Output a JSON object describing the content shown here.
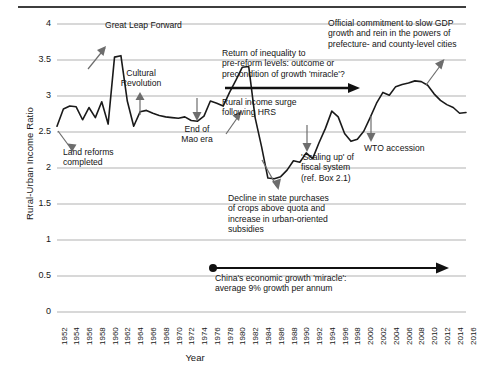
{
  "figure": {
    "y_axis_title": "Rural-Urban Income Ratio",
    "x_axis_title": "Year"
  },
  "chart_data": {
    "type": "line",
    "title": "",
    "xlabel": "Year",
    "ylabel": "Rural-Urban Income Ratio",
    "ylim": [
      0,
      4
    ],
    "ytick_labels": [
      "0",
      "0.5",
      "1",
      "1.5",
      "2",
      "2.5",
      "3",
      "3.5",
      "4"
    ],
    "ytick_values": [
      0,
      0.5,
      1,
      1.5,
      2,
      2.5,
      3,
      3.5,
      4
    ],
    "grid": "horizontal",
    "legend": "none",
    "xtick_labels": [
      "1952",
      "1954",
      "1956",
      "1958",
      "1960",
      "1962",
      "1964",
      "1966",
      "1968",
      "1970",
      "1972",
      "1974",
      "1976",
      "1978",
      "1980",
      "1982",
      "1984",
      "1986",
      "1988",
      "1990",
      "1992",
      "1994",
      "1996",
      "1998",
      "2000",
      "2002",
      "2004",
      "2006",
      "2008",
      "2010",
      "2012",
      "2014",
      "2016"
    ],
    "x": [
      1952,
      1953,
      1954,
      1955,
      1956,
      1957,
      1958,
      1959,
      1960,
      1961,
      1962,
      1963,
      1964,
      1965,
      1966,
      1967,
      1968,
      1969,
      1970,
      1971,
      1972,
      1973,
      1974,
      1975,
      1976,
      1977,
      1978,
      1979,
      1980,
      1981,
      1982,
      1983,
      1984,
      1985,
      1986,
      1987,
      1988,
      1989,
      1990,
      1991,
      1992,
      1993,
      1994,
      1995,
      1996,
      1997,
      1998,
      1999,
      2000,
      2001,
      2002,
      2003,
      2004,
      2005,
      2006,
      2007,
      2008,
      2009,
      2010,
      2011,
      2012,
      2013,
      2014,
      2015,
      2016
    ],
    "values": [
      2.58,
      2.82,
      2.86,
      2.85,
      2.67,
      2.84,
      2.7,
      2.92,
      2.61,
      3.54,
      3.56,
      2.93,
      2.58,
      2.78,
      2.8,
      2.76,
      2.73,
      2.71,
      2.7,
      2.69,
      2.71,
      2.66,
      2.65,
      2.72,
      2.93,
      2.9,
      2.86,
      3.05,
      3.22,
      3.4,
      3.41,
      2.7,
      2.3,
      1.86,
      1.85,
      1.88,
      1.97,
      2.1,
      2.08,
      2.21,
      2.13,
      2.35,
      2.55,
      2.79,
      2.71,
      2.48,
      2.37,
      2.4,
      2.51,
      2.7,
      2.9,
      3.05,
      3.01,
      3.13,
      3.16,
      3.18,
      3.21,
      3.2,
      3.15,
      3.03,
      2.94,
      2.88,
      2.84,
      2.76,
      2.77
    ],
    "annotations": [
      {
        "id": "land-reforms",
        "text": "Land reforms\ncompleted",
        "arrow": "down-left-to-upper-left"
      },
      {
        "id": "great-leap-forward",
        "text": "Great Leap Forward",
        "arrow": "up-left"
      },
      {
        "id": "cultural-revolution",
        "text": "Cultural\nRevolution",
        "arrow": "up"
      },
      {
        "id": "end-of-mao-era",
        "text": "End of\nMao era",
        "arrow": "down"
      },
      {
        "id": "return-of-inequality",
        "text": "Return of inequality to\npre-reform levels: outcome or\nprecondition of growth 'miracle'?",
        "arrow": "right-long"
      },
      {
        "id": "rural-income-surge",
        "text": "Rural income surge\nfollowing HRS",
        "arrow": "up-left"
      },
      {
        "id": "decline-state-purchases",
        "text": "Decline in state purchases\nof crops above quota and\nincrease in urban-oriented\nsubsidies",
        "arrow": "down-right"
      },
      {
        "id": "scaling-up-fiscal-system",
        "text": "'Scaling up' of\nfiscal system\n(ref. Box 2.1)",
        "arrow": "down"
      },
      {
        "id": "wto-accession",
        "text": "WTO accession",
        "arrow": "down"
      },
      {
        "id": "official-commitment",
        "text": "Official commitment to slow GDP\ngrowth and rein in the powers of\nprefecture- and county-level cities",
        "arrow": "up-right"
      },
      {
        "id": "growth-miracle-timeline",
        "text": "China's economic growth 'miracle':\naverage 9% growth per annum",
        "arrow": "right-long-timeline"
      }
    ]
  },
  "colors": {
    "series_line": "#1a1a1a",
    "gridline": "#a8a8a8",
    "text": "#141414",
    "top_rule": "#3d3d3d"
  }
}
